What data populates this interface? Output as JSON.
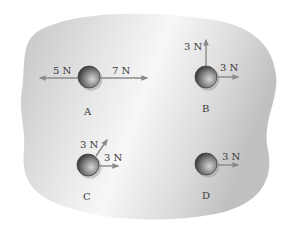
{
  "diagram": {
    "colors": {
      "background": "#ffffff",
      "blob_light": "#f4f4f4",
      "blob_dark": "#bdbdbd",
      "arrow": "#8a8a8a",
      "ball_dark": "#3a3a3a",
      "ball_light": "#c8c8c8",
      "text": "#3a3a3a"
    },
    "objects": [
      {
        "id": "A",
        "caption": "A",
        "forces": [
          {
            "label": "5 N",
            "magnitude_N": 5,
            "direction": "left"
          },
          {
            "label": "7 N",
            "magnitude_N": 7,
            "direction": "right"
          }
        ]
      },
      {
        "id": "B",
        "caption": "B",
        "forces": [
          {
            "label": "3 N",
            "magnitude_N": 3,
            "direction": "up"
          },
          {
            "label": "3 N",
            "magnitude_N": 3,
            "direction": "right"
          }
        ]
      },
      {
        "id": "C",
        "caption": "C",
        "forces": [
          {
            "label": "3 N",
            "magnitude_N": 3,
            "direction": "up-right (diagonal)"
          },
          {
            "label": "3 N",
            "magnitude_N": 3,
            "direction": "right"
          }
        ]
      },
      {
        "id": "D",
        "caption": "D",
        "forces": [
          {
            "label": "3 N",
            "magnitude_N": 3,
            "direction": "right"
          }
        ]
      }
    ]
  }
}
